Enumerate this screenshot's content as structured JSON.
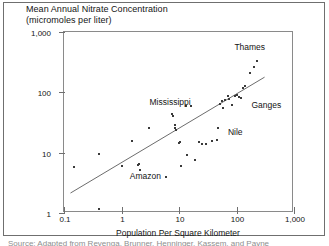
{
  "figure": {
    "title_lines": [
      "Mean Annual Nitrate Concentration",
      "(micromoles per liter)"
    ],
    "caption": "Source: Adapted from Revenga, Brunner, Henninger, Kassem, and Payne"
  },
  "chart_data": {
    "type": "scatter",
    "title": "Mean Annual Nitrate Concentration (micromoles per liter)",
    "xlabel": "Population Per Square Kilometer",
    "ylabel": "Mean Annual Nitrate Concentration (micromoles per liter)",
    "xscale": "log",
    "yscale": "log",
    "xlim": [
      0.1,
      1000
    ],
    "ylim": [
      1,
      1000
    ],
    "grid": false,
    "legend": "none",
    "xticks": [
      "0.1",
      "1",
      "10",
      "100",
      "1,000"
    ],
    "xtick_values": [
      0.1,
      1,
      10,
      100,
      1000
    ],
    "yticks": [
      "1",
      "10",
      "100",
      "1,000"
    ],
    "ytick_values": [
      1,
      10,
      100,
      1000
    ],
    "points": [
      {
        "x": 0.15,
        "y": 5.8
      },
      {
        "x": 0.4,
        "y": 9.5
      },
      {
        "x": 0.4,
        "y": 1.15
      },
      {
        "x": 1.0,
        "y": 6.0
      },
      {
        "x": 1.5,
        "y": 15.5
      },
      {
        "x": 1.9,
        "y": 6.3
      },
      {
        "x": 2.0,
        "y": 6.6
      },
      {
        "x": 2.1,
        "y": 5.1
      },
      {
        "x": 3.0,
        "y": 26.0
      },
      {
        "x": 6.0,
        "y": 3.9
      },
      {
        "x": 7.5,
        "y": 44.0
      },
      {
        "x": 8.0,
        "y": 41.0
      },
      {
        "x": 8.5,
        "y": 29.0
      },
      {
        "x": 8.6,
        "y": 25.5
      },
      {
        "x": 9.0,
        "y": 24.0
      },
      {
        "x": 10.0,
        "y": 14.5
      },
      {
        "x": 10.5,
        "y": 15.0
      },
      {
        "x": 11.0,
        "y": 6.0
      },
      {
        "x": 13.0,
        "y": 60.0
      },
      {
        "x": 14.0,
        "y": 9.3
      },
      {
        "x": 16.0,
        "y": 60.0
      },
      {
        "x": 19.0,
        "y": 7.6
      },
      {
        "x": 22.0,
        "y": 15.2
      },
      {
        "x": 38.0,
        "y": 15.4
      },
      {
        "x": 45.0,
        "y": 16.0
      },
      {
        "x": 48.0,
        "y": 26.0
      },
      {
        "x": 55.0,
        "y": 72.0
      },
      {
        "x": 62.0,
        "y": 75.0
      },
      {
        "x": 70.0,
        "y": 88.0
      },
      {
        "x": 75.0,
        "y": 79.0
      },
      {
        "x": 85.0,
        "y": 62.0
      },
      {
        "x": 95.0,
        "y": 88.0
      },
      {
        "x": 130.0,
        "y": 120.0
      },
      {
        "x": 140.0,
        "y": 125.0
      },
      {
        "x": 170.0,
        "y": 210.0
      },
      {
        "x": 200.0,
        "y": 260.0
      },
      {
        "x": 230.0,
        "y": 330.0
      },
      {
        "x": 120.0,
        "y": 80.0
      },
      {
        "x": 110.0,
        "y": 84.0
      },
      {
        "x": 100.0,
        "y": 92.0
      },
      {
        "x": 52.0,
        "y": 64.0
      },
      {
        "x": 58.0,
        "y": 55.0
      },
      {
        "x": 30.0,
        "y": 14.0
      },
      {
        "x": 25.0,
        "y": 13.8
      }
    ],
    "trend_line": {
      "label": "regression trend",
      "x_start": 0.13,
      "y_start": 2.0,
      "x_end": 330.0,
      "y_end": 175.0
    },
    "annotations": [
      {
        "text": "Thames",
        "x": 170.0,
        "y": 560.0
      },
      {
        "text": "Mississippi",
        "x": 7.0,
        "y": 70.0
      },
      {
        "text": "Ganges",
        "x": 330.0,
        "y": 62.0
      },
      {
        "text": "Nile",
        "x": 95.0,
        "y": 22.0
      },
      {
        "text": "Amazon",
        "x": 2.6,
        "y": 4.1
      }
    ]
  }
}
